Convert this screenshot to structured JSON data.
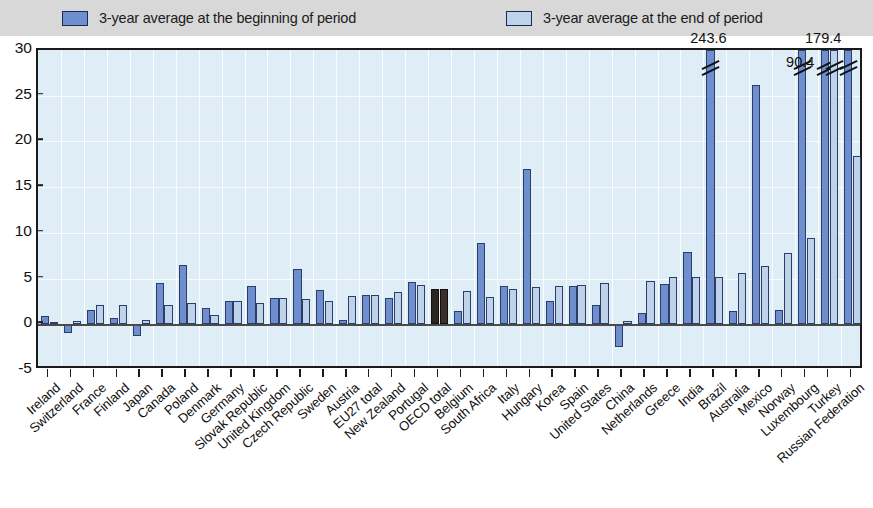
{
  "legend": {
    "entries": [
      {
        "label": "3-year average at the beginning of period",
        "color": "#6e8ecd",
        "icon": "legend-swatch-begin"
      },
      {
        "label": "3-year average at the end of period",
        "color": "#bed2ea",
        "icon": "legend-swatch-end"
      }
    ]
  },
  "axis": {
    "y_ticks": [
      "30",
      "25",
      "20",
      "15",
      "10",
      "5",
      "0",
      "-5"
    ]
  },
  "colors": {
    "begin_bar": "#6e8ecd",
    "end_bar": "#bed2ea",
    "highlight_bar": "#2b2522",
    "plot_background": "#dfedf7",
    "legend_background": "#d8d8d8",
    "axis": "#1a1a1a"
  },
  "chart_data": {
    "type": "bar",
    "title": "",
    "subtitle": "",
    "xlabel": "",
    "ylabel": "",
    "ylim": [
      -5,
      30
    ],
    "ytick_step": 5,
    "grid": true,
    "legend_position": "top",
    "highlight_category": "OECD total",
    "categories": [
      "Ireland",
      "Switzerland",
      "France",
      "Finland",
      "Japan",
      "Canada",
      "Poland",
      "Denmark",
      "Germany",
      "Slovak Republic",
      "United Kingdom",
      "Czech Republic",
      "Sweden",
      "Austria",
      "EU27 total",
      "New Zealand",
      "Portugal",
      "OECD total",
      "Belgium",
      "South Africa",
      "Italy",
      "Hungary",
      "Korea",
      "Spain",
      "United States",
      "China",
      "Netherlands",
      "Greece",
      "India",
      "Brazil",
      "Australia",
      "Mexico",
      "Norway",
      "Luxembourg",
      "Turkey",
      "Russian Federation"
    ],
    "series": [
      {
        "name": "3-year average at the beginning of period",
        "values": [
          0.9,
          -0.9,
          1.6,
          0.7,
          -1.3,
          4.5,
          6.5,
          1.8,
          2.6,
          4.2,
          2.9,
          6.1,
          3.8,
          0.5,
          3.2,
          2.9,
          4.6,
          3.9,
          1.4,
          8.9,
          4.2,
          17.0,
          2.6,
          4.2,
          2.1,
          -2.5,
          1.2,
          4.4,
          7.9,
          243.6,
          1.5,
          26.2,
          1.6,
          90.4,
          179.4,
          179.4
        ]
      },
      {
        "name": "3-year average at the end of period",
        "values": [
          0.3,
          0.4,
          2.1,
          2.1,
          0.5,
          2.1,
          2.3,
          1.0,
          2.6,
          2.3,
          2.9,
          2.8,
          2.6,
          3.1,
          3.2,
          3.5,
          4.3,
          3.9,
          3.6,
          3.0,
          3.9,
          4.1,
          4.2,
          4.3,
          4.5,
          0.4,
          4.7,
          5.2,
          5.2,
          5.2,
          5.6,
          6.4,
          7.8,
          9.4,
          9.4,
          18.4
        ]
      }
    ],
    "broken_bars": [
      {
        "category": "Brazil",
        "series": "begin",
        "label": "243.6"
      },
      {
        "category": "Luxembourg",
        "series": "begin",
        "label": "90.4"
      },
      {
        "category": "Turkey",
        "series": "begin",
        "label": "179.4"
      },
      {
        "category": "Turkey",
        "series": "end",
        "label": ""
      },
      {
        "category": "Russian Federation",
        "series": "begin",
        "label": ""
      }
    ],
    "value_labels": [
      {
        "text": "243.6",
        "category": "Brazil"
      },
      {
        "text": "90.4",
        "category": "Luxembourg"
      },
      {
        "text": "179.4",
        "category": "Turkey"
      }
    ]
  }
}
